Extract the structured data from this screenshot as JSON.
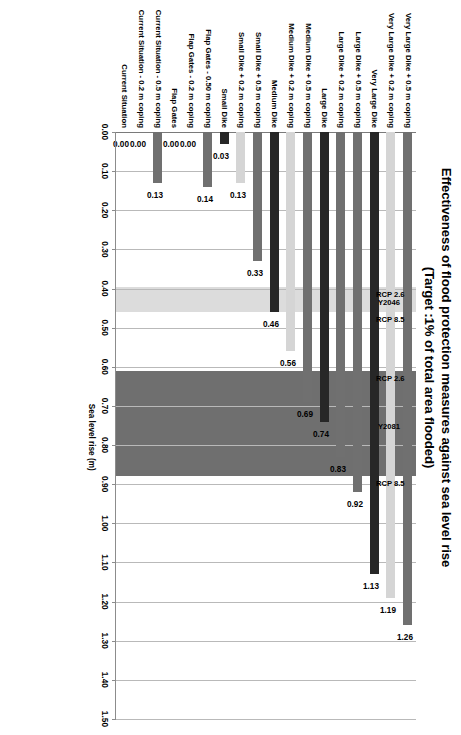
{
  "chart_data": {
    "type": "bar",
    "orientation": "horizontal",
    "title": "Effectiveness of flood protection measures against sea level rise",
    "subtitle": "(Target :1% of total area flooded)",
    "xlabel": "Sea level rise (m)",
    "ylabel": "",
    "xlim": [
      0.0,
      1.5
    ],
    "xticks": [
      "0.00",
      "0.10",
      "0.20",
      "0.30",
      "0.40",
      "0.50",
      "0.60",
      "0.70",
      "0.80",
      "0.90",
      "1.00",
      "1.10",
      "1.20",
      "1.30",
      "1.40",
      "1.50"
    ],
    "xtick_values": [
      0.0,
      0.1,
      0.2,
      0.3,
      0.4,
      0.5,
      0.6,
      0.7,
      0.8,
      0.9,
      1.0,
      1.1,
      1.2,
      1.3,
      1.4,
      1.5
    ],
    "grid": true,
    "legend": null,
    "categories": [
      "Very Large Dike + 0.5 m coping",
      "Very Large Dike + 0.2 m coping",
      "Very Large Dike",
      "Large Dike + 0.5 m coping",
      "Large Dike + 0.2 m coping",
      "Large Dike",
      "Medium Dike + 0.5 m coping",
      "Medium Dike + 0.2 m coping",
      "Medium Dike",
      "Small Dike + 0.5 m coping",
      "Small Dike + 0.2 m coping",
      "Small Dike",
      "Flap Gates - 0.50 m coping",
      "Flap Gates - 0.2 m coping",
      "Flap Gates",
      "Current Situation - 0.5 m coping",
      "Current Situation - 0.2 m coping",
      "Current Situation"
    ],
    "values": [
      1.26,
      1.19,
      1.13,
      0.92,
      0.83,
      0.74,
      0.69,
      0.56,
      0.46,
      0.33,
      0.13,
      0.03,
      0.14,
      0.0,
      0.0,
      0.13,
      0.0,
      0.0
    ],
    "value_labels": [
      "1.26",
      "1.19",
      "1.13",
      "0.92",
      "0.83",
      "0.74",
      "0.69",
      "0.56",
      "0.46",
      "0.33",
      "0.13",
      "0.03",
      "0.14",
      "0.00",
      "0.00",
      "0.13",
      "0.00",
      "0.00"
    ],
    "bar_colors": [
      "#707070",
      "#d5d5d5",
      "#272727",
      "#707070",
      "#707070",
      "#272727",
      "#707070",
      "#d5d5d5",
      "#272727",
      "#707070",
      "#d5d5d5",
      "#272727",
      "#707070",
      "#d5d5d5",
      "#272727",
      "#707070",
      "#d5d5d5",
      "#272727"
    ],
    "annotations": [
      {
        "name": "Y2081",
        "label": "Y2081",
        "lower_label": "RCP 2.6",
        "upper_label": "RCP 8.5",
        "range": [
          0.61,
          0.88
        ],
        "color": "#6f6f6f"
      },
      {
        "name": "Y2046",
        "label": "Y2046",
        "lower_label": "RCP 2.6",
        "upper_label": "RCP 8.5",
        "range": [
          0.395,
          0.46
        ],
        "color": "#dcdcdc"
      }
    ],
    "colors": {
      "grid": "#b9b9b9",
      "axis": "#8c8c8c",
      "background": "#ffffff",
      "band_2081": "#6f6f6f",
      "band_2046": "#dcdcdc"
    }
  }
}
